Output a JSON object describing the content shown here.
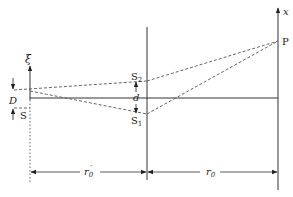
{
  "diagram": {
    "type": "double-slit interference geometry",
    "labels": {
      "xi_axis": "ξ",
      "x_axis": "x",
      "point_P": "P",
      "source_S": "S",
      "slit_S2": "S",
      "slit_S2_sub": "2",
      "slit_S1": "S",
      "slit_S1_sub": "1",
      "slit_separation": "d",
      "source_width": "D",
      "dist_source_to_slits": "r",
      "dist_source_to_slits_sub": "0",
      "dist_source_to_slits_prime": "′",
      "dist_slits_to_screen": "r",
      "dist_slits_to_screen_sub": "0"
    },
    "colors": {
      "line": "#333333",
      "dashed": "#555555"
    }
  }
}
